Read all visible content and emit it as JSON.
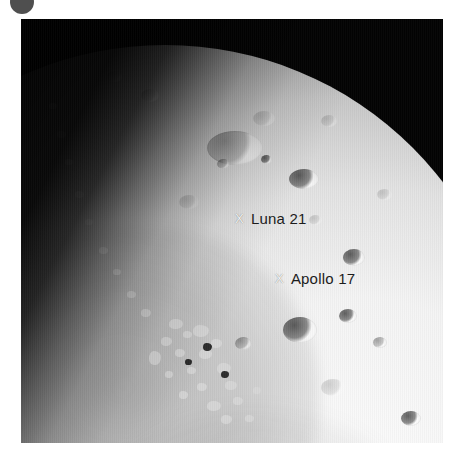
{
  "badge": {
    "icon": "filled-circle-badge",
    "color": "#4f4f4f"
  },
  "photo": {
    "subject": "Moon",
    "description": "Telescopic black-and-white photograph of the Moon showing the bright limb at upper right, a dark mare plain, rugged highlands and the shadowed terminator running diagonally to the lower left.",
    "background_color": "#030303",
    "highlight_color": "#fbfbfb"
  },
  "annotations": [
    {
      "marker": "X",
      "name": "Luna 21",
      "text_color": "#1c1c1c",
      "marker_color": "#f2f2f2"
    },
    {
      "marker": "X",
      "name": "Apollo 17",
      "text_color": "#1c1c1c",
      "marker_color": "#f2f2f2"
    }
  ]
}
